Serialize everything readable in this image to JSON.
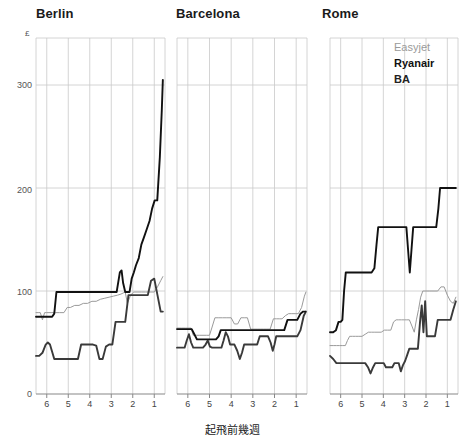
{
  "figure": {
    "y_unit_symbol": "£",
    "xaxis_title": "起飛前幾週",
    "y_ticks": [
      "300",
      "200",
      "100",
      "0"
    ],
    "x_ticks": [
      "6",
      "5",
      "4",
      "3",
      "2",
      "1"
    ]
  },
  "legend": {
    "easyjet": "Easyjet",
    "ryanair": "Ryanair",
    "ba": "BA"
  },
  "panels": {
    "berlin": {
      "title": "Berlin"
    },
    "barcelona": {
      "title": "Barcelona"
    },
    "rome": {
      "title": "Rome"
    }
  },
  "colors": {
    "easyjet": "#9a9a9a",
    "ryanair": "#3a3a3a",
    "ba": "#111111",
    "grid": "#c9c9c9",
    "axis": "#888888",
    "background": "#ffffff"
  },
  "chart_data": {
    "type": "line",
    "subtitle": "",
    "xlabel": "起飛前幾週",
    "ylabel": "£",
    "xlim": [
      6.5,
      0.5
    ],
    "ylim": [
      0,
      340
    ],
    "x_inverted": true,
    "grid": true,
    "legend_position": "top-right-of-rome-panel",
    "x_tick_values": [
      6,
      5,
      4,
      3,
      2,
      1
    ],
    "y_tick_values": [
      0,
      100,
      200,
      300
    ],
    "panels": [
      {
        "name": "Berlin",
        "series": [
          {
            "name": "Easyjet",
            "color": "#9a9a9a",
            "x": [
              6.5,
              6.4,
              6.3,
              6.2,
              6.1,
              6.0,
              5.8,
              5.6,
              5.4,
              5.2,
              5.05,
              4.9,
              4.7,
              4.5,
              4.3,
              4.1,
              3.9,
              3.7,
              3.5,
              3.3,
              3.1,
              2.9,
              2.7,
              2.55,
              2.45,
              2.35,
              2.25,
              2.1,
              1.95,
              1.8,
              1.6,
              1.4,
              1.2,
              1.0,
              0.85,
              0.7,
              0.6
            ],
            "y": [
              79,
              79,
              79,
              72,
              79,
              79,
              79,
              79,
              79,
              79,
              84,
              84,
              86,
              86,
              88,
              88,
              90,
              90,
              92,
              93,
              94,
              95,
              96,
              97,
              98,
              99,
              88,
              96,
              99,
              99,
              99,
              99,
              99,
              99,
              104,
              110,
              114
            ]
          },
          {
            "name": "Ryanair",
            "color": "#3a3a3a",
            "x": [
              6.5,
              6.35,
              6.2,
              6.05,
              5.95,
              5.85,
              5.75,
              5.65,
              5.5,
              5.3,
              5.1,
              4.9,
              4.7,
              4.55,
              4.4,
              4.2,
              4.0,
              3.85,
              3.7,
              3.55,
              3.4,
              3.25,
              3.1,
              2.95,
              2.8,
              2.65,
              2.5,
              2.35,
              2.2,
              2.05,
              1.9,
              1.75,
              1.6,
              1.45,
              1.3,
              1.15,
              1.0,
              0.85,
              0.7,
              0.6
            ],
            "y": [
              37,
              37,
              40,
              48,
              50,
              48,
              41,
              34,
              34,
              34,
              34,
              34,
              34,
              34,
              48,
              48,
              48,
              48,
              47,
              34,
              34,
              46,
              48,
              48,
              70,
              70,
              70,
              70,
              96,
              96,
              96,
              96,
              96,
              96,
              96,
              110,
              112,
              96,
              80,
              80
            ]
          },
          {
            "name": "BA",
            "color": "#111111",
            "x": [
              6.5,
              6.3,
              6.1,
              5.9,
              5.75,
              5.65,
              5.55,
              5.4,
              5.2,
              5.0,
              4.8,
              4.6,
              4.4,
              4.2,
              4.0,
              3.8,
              3.6,
              3.4,
              3.2,
              3.05,
              2.9,
              2.75,
              2.6,
              2.52,
              2.45,
              2.35,
              2.25,
              2.15,
              2.05,
              1.95,
              1.85,
              1.72,
              1.6,
              1.48,
              1.35,
              1.22,
              1.1,
              0.98,
              0.86,
              0.74,
              0.65,
              0.6
            ],
            "y": [
              75,
              75,
              75,
              75,
              75,
              78,
              99,
              99,
              99,
              99,
              99,
              99,
              99,
              99,
              99,
              99,
              99,
              99,
              99,
              99,
              99,
              99,
              118,
              120,
              108,
              99,
              99,
              99,
              112,
              118,
              125,
              132,
              145,
              152,
              160,
              168,
              180,
              188,
              188,
              230,
              275,
              305
            ]
          }
        ]
      },
      {
        "name": "Barcelona",
        "series": [
          {
            "name": "Easyjet",
            "color": "#9a9a9a",
            "x": [
              6.5,
              6.3,
              6.1,
              5.95,
              5.85,
              5.75,
              5.6,
              5.45,
              5.3,
              5.15,
              5.0,
              4.88,
              4.75,
              4.6,
              4.4,
              4.2,
              4.0,
              3.85,
              3.7,
              3.55,
              3.4,
              3.25,
              3.1,
              2.95,
              2.8,
              2.65,
              2.5,
              2.35,
              2.2,
              2.05,
              1.9,
              1.78,
              1.65,
              1.5,
              1.35,
              1.2,
              1.05,
              0.9,
              0.75,
              0.62,
              0.55
            ],
            "y": [
              64,
              64,
              64,
              64,
              64,
              57,
              57,
              57,
              57,
              57,
              57,
              65,
              74,
              74,
              74,
              74,
              74,
              68,
              68,
              74,
              74,
              74,
              63,
              63,
              63,
              63,
              63,
              63,
              63,
              73,
              73,
              73,
              73,
              76,
              78,
              78,
              78,
              78,
              84,
              95,
              99
            ]
          },
          {
            "name": "Ryanair",
            "color": "#3a3a3a",
            "x": [
              6.5,
              6.3,
              6.15,
              6.05,
              5.95,
              5.85,
              5.75,
              5.6,
              5.45,
              5.3,
              5.18,
              5.08,
              4.98,
              4.88,
              4.75,
              4.6,
              4.45,
              4.35,
              4.25,
              4.15,
              4.05,
              3.95,
              3.85,
              3.72,
              3.6,
              3.5,
              3.4,
              3.3,
              3.18,
              3.05,
              2.92,
              2.8,
              2.68,
              2.55,
              2.42,
              2.3,
              2.18,
              2.08,
              2.0,
              1.92,
              1.82,
              1.7,
              1.55,
              1.4,
              1.25,
              1.1,
              0.95,
              0.8,
              0.65,
              0.55
            ],
            "y": [
              45,
              45,
              45,
              52,
              58,
              50,
              45,
              45,
              45,
              45,
              48,
              52,
              46,
              45,
              45,
              45,
              45,
              52,
              60,
              56,
              48,
              48,
              48,
              42,
              34,
              40,
              48,
              48,
              48,
              48,
              48,
              48,
              56,
              56,
              56,
              56,
              50,
              42,
              48,
              56,
              56,
              56,
              56,
              56,
              56,
              56,
              56,
              62,
              76,
              80
            ]
          },
          {
            "name": "BA",
            "color": "#111111",
            "x": [
              6.5,
              6.3,
              6.1,
              5.95,
              5.82,
              5.7,
              5.58,
              5.45,
              5.3,
              5.15,
              5.0,
              4.85,
              4.7,
              4.58,
              4.48,
              4.38,
              4.25,
              4.1,
              3.95,
              3.8,
              3.65,
              3.5,
              3.35,
              3.2,
              3.05,
              2.9,
              2.75,
              2.6,
              2.48,
              2.38,
              2.28,
              2.15,
              2.0,
              1.85,
              1.7,
              1.55,
              1.4,
              1.25,
              1.1,
              0.95,
              0.8,
              0.68,
              0.58
            ],
            "y": [
              63,
              63,
              63,
              63,
              63,
              58,
              53,
              53,
              53,
              53,
              53,
              53,
              53,
              56,
              62,
              62,
              62,
              62,
              62,
              62,
              62,
              62,
              62,
              62,
              62,
              62,
              62,
              62,
              62,
              62,
              62,
              62,
              62,
              62,
              62,
              62,
              72,
              72,
              72,
              72,
              78,
              80,
              80
            ]
          }
        ]
      },
      {
        "name": "Rome",
        "series": [
          {
            "name": "Easyjet",
            "color": "#9a9a9a",
            "x": [
              6.5,
              6.35,
              6.2,
              6.05,
              5.9,
              5.78,
              5.68,
              5.58,
              5.45,
              5.3,
              5.15,
              5.0,
              4.85,
              4.7,
              4.55,
              4.4,
              4.25,
              4.1,
              3.95,
              3.8,
              3.65,
              3.52,
              3.4,
              3.28,
              3.15,
              3.02,
              2.9,
              2.78,
              2.66,
              2.55,
              2.45,
              2.35,
              2.25,
              2.15,
              2.05,
              1.95,
              1.85,
              1.72,
              1.58,
              1.45,
              1.3,
              1.15,
              1.0,
              0.85,
              0.72,
              0.6
            ],
            "y": [
              47,
              47,
              47,
              47,
              47,
              47,
              52,
              56,
              56,
              56,
              56,
              56,
              58,
              60,
              60,
              60,
              60,
              60,
              62,
              62,
              62,
              70,
              72,
              72,
              72,
              72,
              72,
              72,
              66,
              60,
              72,
              82,
              94,
              100,
              100,
              100,
              100,
              100,
              100,
              100,
              104,
              104,
              96,
              90,
              88,
              94
            ]
          },
          {
            "name": "Ryanair",
            "color": "#3a3a3a",
            "x": [
              6.5,
              6.35,
              6.2,
              6.05,
              5.92,
              5.82,
              5.72,
              5.6,
              5.45,
              5.3,
              5.15,
              5.0,
              4.85,
              4.72,
              4.6,
              4.48,
              4.38,
              4.28,
              4.18,
              4.08,
              3.98,
              3.88,
              3.78,
              3.68,
              3.58,
              3.48,
              3.38,
              3.28,
              3.18,
              3.08,
              2.98,
              2.88,
              2.78,
              2.68,
              2.58,
              2.48,
              2.38,
              2.28,
              2.2,
              2.12,
              2.04,
              1.96,
              1.88,
              1.8,
              1.7,
              1.58,
              1.45,
              1.3,
              1.15,
              1.0,
              0.85,
              0.72,
              0.6
            ],
            "y": [
              37,
              34,
              30,
              30,
              30,
              30,
              30,
              30,
              30,
              30,
              30,
              30,
              30,
              26,
              20,
              26,
              30,
              30,
              30,
              30,
              30,
              26,
              26,
              26,
              26,
              30,
              30,
              30,
              22,
              28,
              32,
              38,
              44,
              44,
              44,
              44,
              44,
              70,
              86,
              60,
              90,
              56,
              56,
              56,
              56,
              56,
              72,
              72,
              72,
              72,
              72,
              82,
              90
            ]
          },
          {
            "name": "BA",
            "color": "#111111",
            "x": [
              6.5,
              6.35,
              6.22,
              6.1,
              6.0,
              5.92,
              5.84,
              5.76,
              5.66,
              5.55,
              5.42,
              5.28,
              5.15,
              5.0,
              4.85,
              4.7,
              4.55,
              4.42,
              4.32,
              4.24,
              4.16,
              4.06,
              3.92,
              3.78,
              3.65,
              3.5,
              3.35,
              3.2,
              3.05,
              2.92,
              2.84,
              2.76,
              2.68,
              2.6,
              2.5,
              2.38,
              2.25,
              2.1,
              1.95,
              1.8,
              1.65,
              1.52,
              1.42,
              1.34,
              1.26,
              1.18,
              1.08,
              0.95,
              0.82,
              0.7,
              0.6
            ],
            "y": [
              60,
              60,
              62,
              70,
              70,
              72,
              100,
              118,
              118,
              118,
              118,
              118,
              118,
              118,
              118,
              118,
              118,
              122,
              145,
              162,
              162,
              162,
              162,
              162,
              162,
              162,
              162,
              162,
              162,
              162,
              140,
              118,
              140,
              162,
              162,
              162,
              162,
              162,
              162,
              162,
              162,
              162,
              180,
              200,
              200,
              200,
              200,
              200,
              200,
              200,
              200
            ]
          }
        ]
      }
    ]
  }
}
